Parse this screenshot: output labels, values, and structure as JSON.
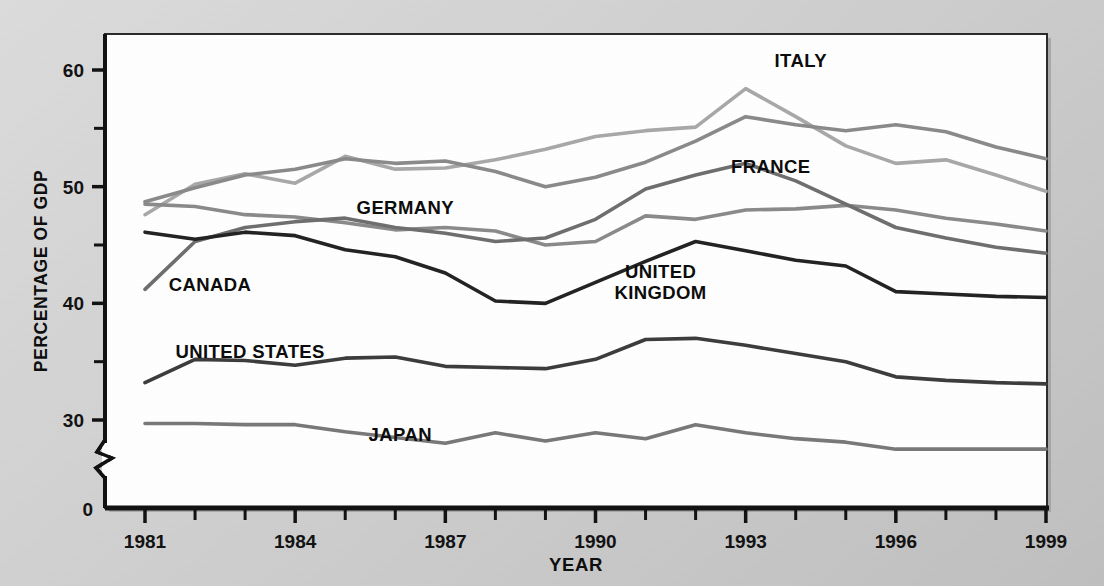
{
  "figure": {
    "background_color": "#d2d2d2",
    "plot_background_color": "#ffffff",
    "frame_color": "#1a1a1a"
  },
  "axis": {
    "y_title": "PERCENTAGE OF GDP",
    "x_title": "YEAR",
    "y_zero_label": "0",
    "y_major_labels": [
      "60",
      "50",
      "40",
      "30"
    ],
    "y_major_values": [
      60,
      50,
      40,
      30
    ],
    "y_minor_values": [
      55,
      45,
      35
    ],
    "x_tick_labels": [
      "1981",
      "1984",
      "1987",
      "1990",
      "1993",
      "1996",
      "1999"
    ],
    "x_tick_values": [
      1981,
      1984,
      1987,
      1990,
      1993,
      1996,
      1999
    ],
    "has_axis_break": true,
    "axis_break_symbol": "zigzag"
  },
  "chart_data": {
    "type": "line",
    "title": "",
    "subtitle": "",
    "xlabel": "YEAR",
    "ylabel": "PERCENTAGE OF GDP",
    "xlim": [
      1981,
      1999
    ],
    "ylim": [
      27,
      62
    ],
    "grid": false,
    "legend": "inline-annotations",
    "x": [
      1981,
      1982,
      1983,
      1984,
      1985,
      1986,
      1987,
      1988,
      1989,
      1990,
      1991,
      1992,
      1993,
      1994,
      1995,
      1996,
      1997,
      1998,
      1999
    ],
    "series": [
      {
        "name": "ITALY",
        "color": "#a8a8a8",
        "label_x": 1994.1,
        "label_y": 60.3,
        "values": [
          47.6,
          50.2,
          51.1,
          50.3,
          52.6,
          51.5,
          51.6,
          52.3,
          53.2,
          54.3,
          54.8,
          55.1,
          58.4,
          56.0,
          53.5,
          52.0,
          52.3,
          51.0,
          49.6
        ]
      },
      {
        "name": "FRANCE",
        "color": "#8a8a8a",
        "label_x": 1993.5,
        "label_y": 51.2,
        "values": [
          48.7,
          49.9,
          51.0,
          51.5,
          52.4,
          52.0,
          52.2,
          51.3,
          50.0,
          50.8,
          52.1,
          53.9,
          56.0,
          55.3,
          54.8,
          55.3,
          54.7,
          53.4,
          52.4
        ]
      },
      {
        "name": "GERMANY",
        "color": "#8a8a8a",
        "label_x": 1986.2,
        "label_y": 47.7,
        "values": [
          48.5,
          48.3,
          47.6,
          47.4,
          46.9,
          46.3,
          46.5,
          46.2,
          45.0,
          45.3,
          47.5,
          47.2,
          48.0,
          48.1,
          48.4,
          48.0,
          47.3,
          46.8,
          46.2
        ]
      },
      {
        "name": "CANADA",
        "color": "#6e6e6e",
        "label_x": 1982.3,
        "label_y": 41.1,
        "values": [
          41.2,
          45.3,
          46.5,
          47.0,
          47.3,
          46.5,
          46.0,
          45.3,
          45.6,
          47.2,
          49.8,
          51.0,
          52.0,
          50.5,
          48.5,
          46.5,
          45.6,
          44.8,
          44.3
        ]
      },
      {
        "name": "UNITED KINGDOM",
        "color": "#222222",
        "label_x": 1991.3,
        "label_y": 42.2,
        "values": [
          46.1,
          45.5,
          46.1,
          45.8,
          44.6,
          44.0,
          42.6,
          40.2,
          40.0,
          41.8,
          43.6,
          45.3,
          44.5,
          43.7,
          43.2,
          41.0,
          40.8,
          40.6,
          40.5
        ]
      },
      {
        "name": "UNITED STATES",
        "color": "#3c3c3c",
        "label_x": 1983.1,
        "label_y": 35.3,
        "values": [
          33.2,
          35.2,
          35.1,
          34.7,
          35.3,
          35.4,
          34.6,
          34.5,
          34.4,
          35.2,
          36.9,
          37.0,
          36.4,
          35.7,
          35.0,
          33.7,
          33.4,
          33.2,
          33.1
        ]
      },
      {
        "name": "JAPAN",
        "color": "#787878",
        "label_x": 1986.1,
        "label_y": 28.2,
        "values": [
          29.7,
          29.7,
          29.6,
          29.6,
          29.0,
          28.5,
          28.0,
          28.9,
          28.2,
          28.9,
          28.4,
          29.6,
          28.9,
          28.4,
          28.1,
          27.5,
          27.5,
          27.5,
          27.5
        ]
      }
    ]
  }
}
